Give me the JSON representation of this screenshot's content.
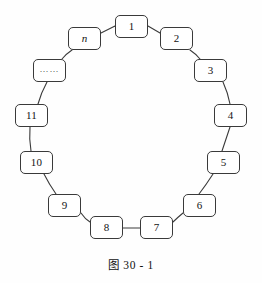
{
  "figure": {
    "caption": "图 30 - 1",
    "background_color": "#fefefe",
    "box_border_color": "#3a3a3a",
    "box_fill_color": "#ffffff",
    "connector_color": "#3a3a3a"
  },
  "nodes": [
    {
      "id": "node-1",
      "label": "1",
      "x": 115,
      "y": 15,
      "w": 33,
      "h": 23,
      "italic": false,
      "type": "number"
    },
    {
      "id": "node-2",
      "label": "2",
      "x": 160,
      "y": 27,
      "w": 33,
      "h": 23,
      "italic": false,
      "type": "number"
    },
    {
      "id": "node-3",
      "label": "3",
      "x": 194,
      "y": 59,
      "w": 33,
      "h": 23,
      "italic": false,
      "type": "number"
    },
    {
      "id": "node-4",
      "label": "4",
      "x": 214,
      "y": 104,
      "w": 33,
      "h": 23,
      "italic": false,
      "type": "number"
    },
    {
      "id": "node-5",
      "label": "5",
      "x": 207,
      "y": 151,
      "w": 33,
      "h": 23,
      "italic": false,
      "type": "number"
    },
    {
      "id": "node-6",
      "label": "6",
      "x": 183,
      "y": 194,
      "w": 33,
      "h": 23,
      "italic": false,
      "type": "number"
    },
    {
      "id": "node-7",
      "label": "7",
      "x": 140,
      "y": 216,
      "w": 33,
      "h": 23,
      "italic": false,
      "type": "number"
    },
    {
      "id": "node-8",
      "label": "8",
      "x": 90,
      "y": 216,
      "w": 33,
      "h": 23,
      "italic": false,
      "type": "number"
    },
    {
      "id": "node-9",
      "label": "9",
      "x": 48,
      "y": 194,
      "w": 33,
      "h": 23,
      "italic": false,
      "type": "number"
    },
    {
      "id": "node-10",
      "label": "10",
      "x": 20,
      "y": 151,
      "w": 33,
      "h": 23,
      "italic": false,
      "type": "number"
    },
    {
      "id": "node-11",
      "label": "11",
      "x": 15,
      "y": 104,
      "w": 33,
      "h": 23,
      "italic": false,
      "type": "number"
    },
    {
      "id": "node-ellipsis",
      "label": "……",
      "x": 33,
      "y": 59,
      "w": 33,
      "h": 23,
      "italic": false,
      "type": "ellipsis"
    },
    {
      "id": "node-n",
      "label": "n",
      "x": 68,
      "y": 27,
      "w": 33,
      "h": 23,
      "italic": true,
      "type": "variable"
    }
  ],
  "connectors": [
    {
      "from": "node-1",
      "to": "node-2",
      "d": "M 148 26 L 160 33"
    },
    {
      "from": "node-2",
      "to": "node-3",
      "d": "M 190 50 Q 196 54 200 59"
    },
    {
      "from": "node-3",
      "to": "node-4",
      "d": "M 223 82 Q 228 93 230 104"
    },
    {
      "from": "node-4",
      "to": "node-5",
      "d": "M 230 127 Q 226 139 222 151"
    },
    {
      "from": "node-5",
      "to": "node-6",
      "d": "M 213 174 Q 206 185 199 194"
    },
    {
      "from": "node-6",
      "to": "node-7",
      "d": "M 183 213 Q 177 218 173 222"
    },
    {
      "from": "node-7",
      "to": "node-8",
      "d": "M 140 228 L 123 228"
    },
    {
      "from": "node-8",
      "to": "node-9",
      "d": "M 90 222 Q 85 219 81 213"
    },
    {
      "from": "node-9",
      "to": "node-10",
      "d": "M 56 194 Q 49 184 44 174"
    },
    {
      "from": "node-10",
      "to": "node-11",
      "d": "M 31 151 Q 29 139 30 127"
    },
    {
      "from": "node-11",
      "to": "node-ellipsis",
      "d": "M 38 104 Q 41 93 47 82"
    },
    {
      "from": "node-ellipsis",
      "to": "node-n",
      "d": "M 62 59 Q 66 54 72 50"
    },
    {
      "from": "node-n",
      "to": "node-1",
      "d": "M 101 33 L 115 26"
    }
  ]
}
